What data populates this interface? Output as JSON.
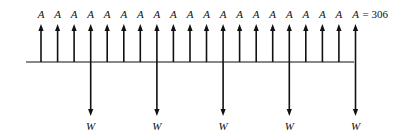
{
  "diagram": {
    "type": "cash-flow-diagram",
    "baseline": {
      "x_start": 26,
      "x_end": 354,
      "y": 62
    },
    "up_arrows": {
      "label": "A",
      "count": 20,
      "x_start": 41,
      "spacing": 16.55,
      "y_base": 62,
      "y_tip": 24,
      "label_y": 9
    },
    "down_arrows": {
      "label": "W",
      "indices": [
        3,
        7,
        11,
        15,
        19
      ],
      "y_base": 62,
      "y_tip": 116,
      "label_y": 121
    },
    "equation": {
      "text": "= 306"
    },
    "color": "#111111"
  }
}
